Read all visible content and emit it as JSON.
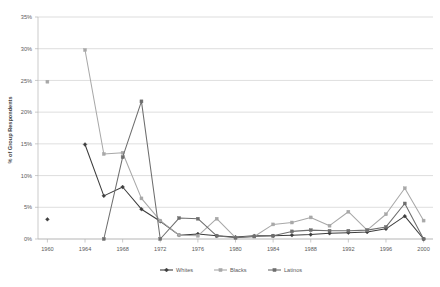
{
  "chart_data": {
    "type": "line",
    "title": "",
    "xlabel": "",
    "ylabel": "% of Group Respondents",
    "xlim": [
      1959,
      2001
    ],
    "ylim": [
      0,
      35
    ],
    "ytick_labels": [
      "0%",
      "5%",
      "10%",
      "15%",
      "20%",
      "25%",
      "30%",
      "35%"
    ],
    "ytick_values": [
      0,
      5,
      10,
      15,
      20,
      25,
      30,
      35
    ],
    "xtick_labels": [
      "1960",
      "1964",
      "1968",
      "1972",
      "1976",
      "1980",
      "1984",
      "1988",
      "1992",
      "1996",
      "2000"
    ],
    "xtick_values": [
      1960,
      1964,
      1968,
      1972,
      1976,
      1980,
      1984,
      1988,
      1992,
      1996,
      2000
    ],
    "grid": true,
    "legend_position": "bottom",
    "series": [
      {
        "name": "Whites",
        "color": "#3d3d3d",
        "marker": "diamond",
        "x": [
          1960,
          1964,
          1966,
          1968,
          1970,
          1972,
          1974,
          1976,
          1978,
          1980,
          1982,
          1984,
          1986,
          1988,
          1990,
          1992,
          1994,
          1996,
          1998,
          2000
        ],
        "y": [
          3.1,
          14.9,
          6.8,
          8.2,
          4.7,
          2.8,
          0.6,
          0.8,
          0.5,
          0.3,
          0.5,
          0.5,
          0.6,
          0.7,
          0.9,
          1.0,
          1.1,
          1.6,
          3.6,
          0.0
        ],
        "gaps": [
          [
            1960,
            1964
          ]
        ]
      },
      {
        "name": "Blacks",
        "color": "#a8a8a8",
        "marker": "square",
        "x": [
          1960,
          1964,
          1966,
          1968,
          1970,
          1972,
          1974,
          1976,
          1978,
          1980,
          1982,
          1984,
          1986,
          1988,
          1990,
          1992,
          1994,
          1996,
          1998,
          2000
        ],
        "y": [
          24.8,
          29.8,
          13.4,
          13.6,
          6.4,
          2.9,
          0.6,
          0.5,
          3.2,
          0.2,
          0.4,
          2.3,
          2.6,
          3.4,
          2.1,
          4.3,
          1.4,
          3.9,
          8.0,
          2.9
        ],
        "gaps": [
          [
            1960,
            1964
          ]
        ]
      },
      {
        "name": "Latinos",
        "color": "#6e6e6e",
        "marker": "square",
        "x": [
          1966,
          1968,
          1970,
          1972,
          1974,
          1976,
          1978,
          1980,
          1982,
          1984,
          1986,
          1988,
          1990,
          1992,
          1994,
          1996,
          1998,
          2000
        ],
        "y": [
          0.0,
          12.9,
          21.7,
          0.0,
          3.3,
          3.2,
          0.5,
          0.2,
          0.4,
          0.5,
          1.2,
          1.4,
          1.3,
          1.3,
          1.4,
          1.9,
          5.6,
          0.0
        ],
        "gaps": []
      }
    ]
  },
  "legend": {
    "entries": [
      {
        "label": "Whites"
      },
      {
        "label": "Blacks"
      },
      {
        "label": "Latinos"
      }
    ]
  },
  "axis": {
    "y_title": "% of Group Respondents"
  },
  "faint_top_text": ""
}
